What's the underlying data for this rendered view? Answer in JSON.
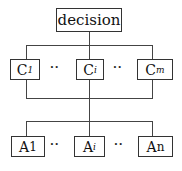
{
  "diagram": {
    "root": {
      "label": "decision"
    },
    "criteria": [
      {
        "label": "C",
        "sub": "1"
      },
      {
        "label": "C",
        "sub": "i"
      },
      {
        "label": "C",
        "sub": "m"
      }
    ],
    "alternatives": [
      {
        "label": "A",
        "sub": "1"
      },
      {
        "label": "A",
        "sub": "i"
      },
      {
        "label": "A",
        "sub": "n"
      }
    ],
    "ellipsis": "··",
    "colors": {
      "line": "#444444",
      "border": "#333333",
      "text": "#111111"
    }
  }
}
